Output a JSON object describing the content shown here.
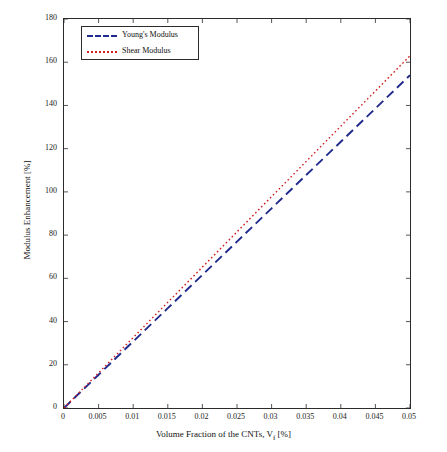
{
  "chart_data": {
    "type": "line",
    "title": "",
    "xlabel": "Volume Fraction of the CNTs, V",
    "xlabel_sub": "f",
    "xlabel_units": " [%]",
    "ylabel": "Modulus Enhancement [%]",
    "xlim": [
      0,
      0.05
    ],
    "ylim": [
      0,
      180
    ],
    "xticks": [
      "0",
      "0.005",
      "0.01",
      "0.015",
      "0.02",
      "0.025",
      "0.03",
      "0.035",
      "0.04",
      "0.045",
      "0.05"
    ],
    "yticks": [
      "0",
      "20",
      "40",
      "60",
      "80",
      "100",
      "120",
      "140",
      "160",
      "180"
    ],
    "grid": false,
    "legend_position": "top-left",
    "series": [
      {
        "name": "Young's Modulus",
        "color": "#1f2a8c",
        "style": "dashed",
        "x": [
          0,
          0.005,
          0.01,
          0.015,
          0.02,
          0.025,
          0.03,
          0.035,
          0.04,
          0.045,
          0.05
        ],
        "values": [
          0,
          15.4,
          30.8,
          46.2,
          61.6,
          77.0,
          92.4,
          107.8,
          123.2,
          138.6,
          154.0
        ]
      },
      {
        "name": "Shear Modulus",
        "color": "#d21f1f",
        "style": "dotted",
        "x": [
          0,
          0.005,
          0.01,
          0.015,
          0.02,
          0.025,
          0.03,
          0.035,
          0.04,
          0.045,
          0.05
        ],
        "values": [
          0,
          16.3,
          32.6,
          48.9,
          65.2,
          81.5,
          97.8,
          114.1,
          130.4,
          146.7,
          163.0
        ]
      }
    ]
  }
}
